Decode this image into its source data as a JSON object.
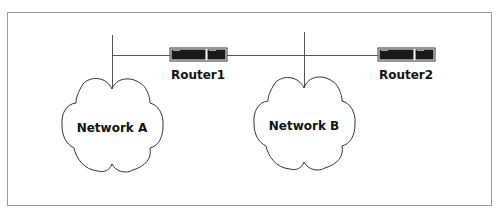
{
  "diagram": {
    "type": "network-topology",
    "colors": {
      "background": "#ffffff",
      "frame": "#9a9a9a",
      "wire": "#555555",
      "cloud_outline": "#333333",
      "router_body": "#1a1a1a",
      "text": "#111111"
    },
    "networks": [
      {
        "id": "network-a",
        "label": "Network A"
      },
      {
        "id": "network-b",
        "label": "Network B"
      }
    ],
    "routers": [
      {
        "id": "router1",
        "label": "Router1"
      },
      {
        "id": "router2",
        "label": "Router2"
      }
    ],
    "connections": [
      {
        "from": "Network A",
        "to": "Router1"
      },
      {
        "from": "Router1",
        "to": "Network B"
      },
      {
        "from": "Network B",
        "to": "Router2"
      }
    ]
  }
}
